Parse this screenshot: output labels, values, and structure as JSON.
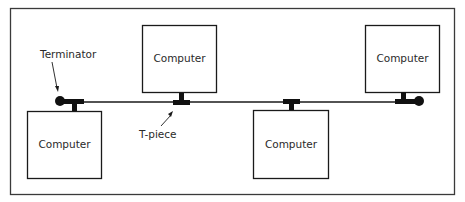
{
  "diagram": {
    "type": "bus-network-topology",
    "colors": {
      "line": "#1a1a1a",
      "frame": "#3a3a3a",
      "text": "#2a2a2a",
      "background": "#ffffff"
    },
    "nodes": [
      {
        "id": "computer-bottom-left",
        "label": "Computer"
      },
      {
        "id": "computer-top-center-left",
        "label": "Computer"
      },
      {
        "id": "computer-bottom-center-right",
        "label": "Computer"
      },
      {
        "id": "computer-top-right",
        "label": "Computer"
      }
    ],
    "connectors": [
      {
        "kind": "terminator",
        "position": "left end"
      },
      {
        "kind": "t-piece",
        "attached_to": "computer-top-center-left"
      },
      {
        "kind": "t-piece",
        "attached_to": "computer-bottom-center-right"
      },
      {
        "kind": "terminator",
        "position": "right end"
      }
    ],
    "annotations": {
      "terminator": "Terminator",
      "t_piece": "T-piece"
    }
  }
}
